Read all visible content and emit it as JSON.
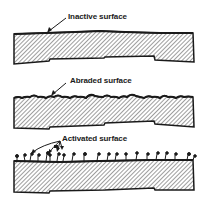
{
  "diagram": {
    "panels": [
      {
        "id": "inactive",
        "label": "Inactive surface"
      },
      {
        "id": "abraded",
        "label": "Abraded surface"
      },
      {
        "id": "activated",
        "label": "Activated surface"
      }
    ]
  },
  "colors": {
    "ink": "#1a1a1a",
    "hatch": "#8a8a8a",
    "background": "#ffffff"
  }
}
